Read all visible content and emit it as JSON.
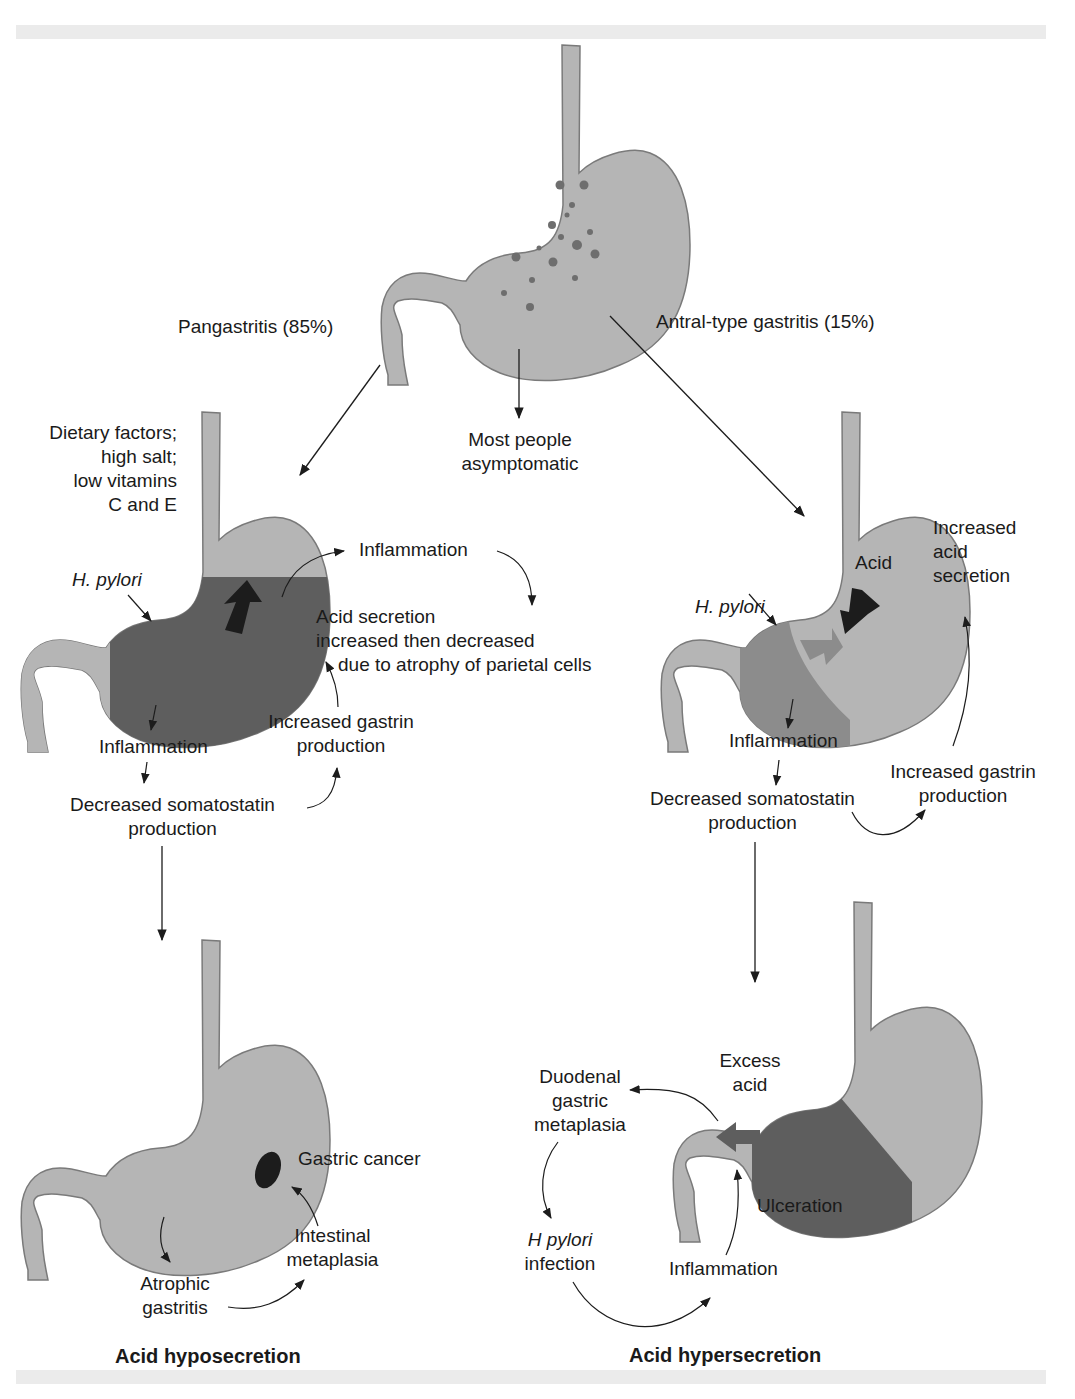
{
  "colors": {
    "stomach_light": "#b5b5b5",
    "stomach_outline": "#7a7a7a",
    "inflamed_dark": "#5e5e5e",
    "inflamed_mid": "#8c8c8c",
    "arrow_black": "#1c1c1c",
    "band": "#ebebeb",
    "text": "#1a1a1a"
  },
  "top": {
    "branch_left": "Pangastritis (85%)",
    "branch_middle": [
      "Most people",
      "asymptomatic"
    ],
    "branch_right": "Antral-type gastritis (15%)"
  },
  "left_mid": {
    "dietary": [
      "Dietary factors;",
      "high salt;",
      "low vitamins",
      "C and E"
    ],
    "h_pylori": "H. pylori",
    "inflammation_top": "Inflammation",
    "acid_secretion": [
      "Acid secretion",
      "increased then decreased",
      "due to atrophy of parietal cells"
    ],
    "gastrin": [
      "Increased gastrin",
      "production"
    ],
    "inflammation": "Inflammation",
    "somatostatin": [
      "Decreased somatostatin",
      "production"
    ]
  },
  "right_mid": {
    "h_pylori": "H. pylori",
    "acid": "Acid",
    "increased_acid": [
      "Increased",
      "acid",
      "secretion"
    ],
    "inflammation": "Inflammation",
    "somatostatin": [
      "Decreased somatostatin",
      "production"
    ],
    "gastrin": [
      "Increased gastrin",
      "production"
    ]
  },
  "left_bottom": {
    "gastric_cancer": "Gastric cancer",
    "intestinal": [
      "Intestinal",
      "metaplasia"
    ],
    "atrophic": [
      "Atrophic",
      "gastritis"
    ],
    "title": "Acid hyposecretion"
  },
  "right_bottom": {
    "excess_acid": [
      "Excess",
      "acid"
    ],
    "duodenal": [
      "Duodenal",
      "gastric",
      "metaplasia"
    ],
    "ulceration": "Ulceration",
    "h_pylori_infection": [
      "H pylori",
      "infection"
    ],
    "inflammation": "Inflammation",
    "title": "Acid hypersecretion"
  }
}
